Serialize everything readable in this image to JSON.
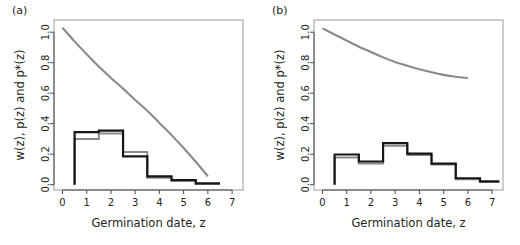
{
  "figure": {
    "width": 520,
    "height": 245,
    "background": "#ffffff",
    "panel_count": 2
  },
  "colors": {
    "black_series": "#161616",
    "gray_series": "#8a8a8a",
    "axis": "#4d4d4d",
    "box": "#9a9a9a",
    "text": "#231f20"
  },
  "panels": [
    {
      "label": "(a)"
    },
    {
      "label": "(b)"
    }
  ],
  "chart_data": [
    {
      "type": "line",
      "panel": "(a)",
      "title": "",
      "xlabel": "Germination date, z",
      "ylabel": "w(z), p(z) and p*(z)",
      "xlim": [
        -0.35,
        7.45
      ],
      "ylim": [
        -0.035,
        1.08
      ],
      "xticks": [
        0,
        1,
        2,
        3,
        4,
        5,
        6,
        7
      ],
      "xticklabels": [
        "0",
        "1",
        "2",
        "3",
        "4",
        "5",
        "6",
        "7"
      ],
      "yticks": [
        0.0,
        0.2,
        0.4,
        0.6,
        0.8,
        1.0
      ],
      "yticklabels": [
        "0.0",
        "0.2",
        "0.4",
        "0.6",
        "0.8",
        "1.0"
      ],
      "grid": false,
      "legend": "none",
      "series": [
        {
          "name": "w(z)",
          "style": "smooth-curve",
          "color": "#8a8a8a",
          "x": [
            0.0,
            0.5,
            1.0,
            1.5,
            2.0,
            2.5,
            3.0,
            3.5,
            4.0,
            4.5,
            5.0,
            5.5,
            6.0
          ],
          "values": [
            1.03,
            0.94,
            0.855,
            0.775,
            0.7,
            0.63,
            0.555,
            0.485,
            0.405,
            0.325,
            0.24,
            0.15,
            0.055
          ]
        },
        {
          "name": "p(z)",
          "style": "step-histogram",
          "color": "#8a8a8a",
          "bin_edges": [
            0.5,
            1.5,
            2.5,
            3.5,
            4.5,
            5.5,
            6.5
          ],
          "values": [
            0.3,
            0.335,
            0.215,
            0.045,
            0.025,
            0.005
          ]
        },
        {
          "name": "p*(z)",
          "style": "step-histogram",
          "color": "#161616",
          "bin_edges": [
            0.5,
            1.5,
            2.5,
            3.5,
            4.5,
            5.5,
            6.5
          ],
          "values": [
            0.345,
            0.355,
            0.185,
            0.055,
            0.03,
            0.008
          ]
        }
      ]
    },
    {
      "type": "line",
      "panel": "(b)",
      "title": "",
      "xlabel": "Germination date, z",
      "ylabel": "w(z), p(z) and p*(z)",
      "xlim": [
        -0.35,
        7.45
      ],
      "ylim": [
        -0.035,
        1.08
      ],
      "xticks": [
        0,
        1,
        2,
        3,
        4,
        5,
        6,
        7
      ],
      "xticklabels": [
        "0",
        "1",
        "2",
        "3",
        "4",
        "5",
        "6",
        "7"
      ],
      "yticks": [
        0.0,
        0.2,
        0.4,
        0.6,
        0.8,
        1.0
      ],
      "yticklabels": [
        "0.0",
        "0.2",
        "0.4",
        "0.6",
        "0.8",
        "1.0"
      ],
      "grid": false,
      "legend": "none",
      "series": [
        {
          "name": "w(z)",
          "style": "smooth-curve",
          "color": "#8a8a8a",
          "x": [
            0.0,
            0.5,
            1.0,
            1.5,
            2.0,
            2.5,
            3.0,
            3.5,
            4.0,
            4.5,
            5.0,
            5.5,
            6.0
          ],
          "values": [
            1.025,
            0.985,
            0.945,
            0.905,
            0.87,
            0.835,
            0.805,
            0.78,
            0.757,
            0.737,
            0.72,
            0.708,
            0.7
          ]
        },
        {
          "name": "p(z)",
          "style": "step-histogram",
          "color": "#8a8a8a",
          "bin_edges": [
            0.5,
            1.5,
            2.5,
            3.5,
            4.5,
            5.5,
            6.5,
            7.3
          ],
          "values": [
            0.178,
            0.138,
            0.255,
            0.195,
            0.132,
            0.035,
            0.018
          ]
        },
        {
          "name": "p*(z)",
          "style": "step-histogram",
          "color": "#161616",
          "bin_edges": [
            0.5,
            1.5,
            2.5,
            3.5,
            4.5,
            5.5,
            6.5,
            7.3
          ],
          "values": [
            0.198,
            0.152,
            0.272,
            0.203,
            0.138,
            0.042,
            0.022
          ]
        }
      ]
    }
  ]
}
